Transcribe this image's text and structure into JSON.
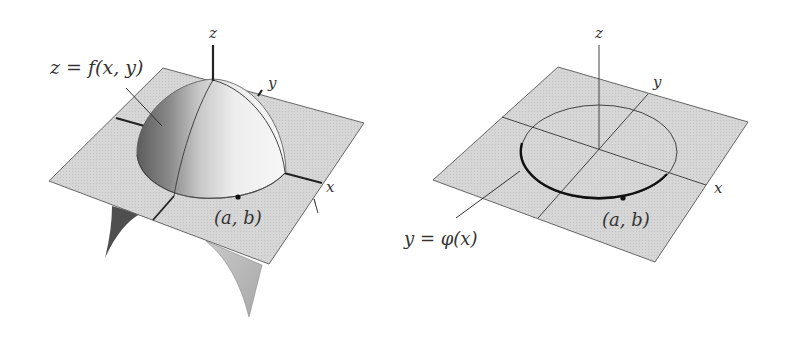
{
  "figures": [
    {
      "id": "left",
      "caption": "surface with constraint",
      "surface_label": "z = f(x, y)",
      "surface_label_parts": {
        "lhs": "z",
        "eq": " = ",
        "fn": "f",
        "args": "(x, y)"
      },
      "axis_labels": {
        "x": "x",
        "y": "y",
        "z": "z"
      },
      "point_label": "(a, b)"
    },
    {
      "id": "right",
      "caption": "constraint curve in xy-plane",
      "curve_label": "y = φ(x)",
      "axis_labels": {
        "x": "x",
        "y": "y",
        "z": "z"
      },
      "point_label": "(a, b)"
    }
  ],
  "colors": {
    "plane_fill": "#d9d9d9",
    "plane_stroke": "#555555",
    "axis": "#222222",
    "dome_light": "#f2f2f2",
    "dome_dark": "#6e6e6e",
    "spike_dark": "#555555",
    "spike_light": "#bdbdbd",
    "curve": "#111111",
    "text": "#333333"
  }
}
